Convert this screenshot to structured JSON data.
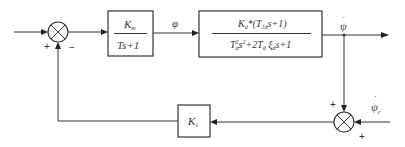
{
  "diagram": {
    "type": "control-block-diagram",
    "input_junction": {
      "signs": {
        "left": "+",
        "bottom": "−"
      }
    },
    "blocks": [
      {
        "id": "actuator",
        "numerator": {
          "main": "K",
          "sub": "m"
        },
        "denominator": "Ts+1"
      },
      {
        "id": "plant",
        "numerator": {
          "K": "K",
          "K_sub": "d",
          "rest1": "*(T",
          "T_sub": "1d",
          "rest2": "s+1)"
        },
        "denominator": {
          "t1": "T",
          "t1_sub": "d",
          "t1_sup": "2",
          "s1": "s",
          "s1_sup": "2",
          "plus1": "+2T",
          "t2_sub": "d",
          "xi": " ξ",
          "xi_sub": "d",
          "tail": "s+1"
        }
      },
      {
        "id": "feedback-gain",
        "label": {
          "main": "K",
          "sub": "1"
        }
      }
    ],
    "signals": {
      "intermediate": "φ",
      "output": {
        "symbol": "ψ",
        "dot": "·"
      },
      "reference": {
        "symbol": "ψ",
        "dot": "·",
        "sub": "c"
      }
    },
    "feedback_junction": {
      "signs": {
        "top": "+",
        "right": "+"
      }
    }
  }
}
